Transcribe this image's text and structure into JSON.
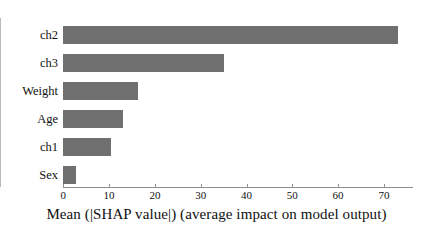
{
  "chart_data": {
    "type": "bar",
    "orientation": "horizontal",
    "title": "",
    "xlabel": "Mean (|SHAP value|) (average impact on model output)",
    "ylabel": "",
    "categories": [
      "ch2",
      "ch3",
      "Weight",
      "Age",
      "ch1",
      "Sex"
    ],
    "values": [
      73.0,
      35.0,
      16.3,
      13.0,
      10.4,
      2.8
    ],
    "xlim": [
      0,
      76
    ],
    "xticks": [
      0,
      10,
      20,
      30,
      40,
      50,
      60,
      70
    ],
    "xtick_labels": [
      "0",
      "10",
      "20",
      "30",
      "40",
      "50",
      "60",
      "70"
    ],
    "grid": false,
    "legend": false,
    "bar_color": "#6f6f6f",
    "axis_color": "#8f8f8f",
    "background": "#ffffff"
  },
  "figure": {
    "xaxis_title": "Mean (|SHAP value|) (average impact on model output)"
  }
}
